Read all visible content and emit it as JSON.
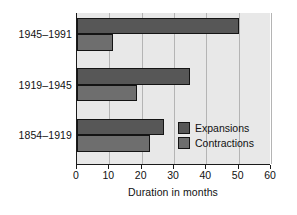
{
  "chart_data": {
    "type": "bar",
    "orientation": "horizontal",
    "title": "",
    "xlabel": "Duration in months",
    "ylabel": "",
    "xlim": [
      0,
      60
    ],
    "xticks": [
      0,
      10,
      20,
      30,
      40,
      50,
      60
    ],
    "xticklabels": [
      "0",
      "10",
      "20",
      "30",
      "40",
      "50",
      "60"
    ],
    "grid": "vertical",
    "categories": [
      "1945–1991",
      "1919–1945",
      "1854–1919"
    ],
    "series": [
      {
        "name": "Expansions",
        "color": "#575757",
        "values": [
          50,
          35,
          27
        ]
      },
      {
        "name": "Contractions",
        "color": "#6e6e6e",
        "values": [
          11,
          18.5,
          22.5
        ]
      }
    ],
    "legend": {
      "position": "inside-lower-right",
      "entries": [
        "Expansions",
        "Contractions"
      ]
    },
    "colors": {
      "plot_background": "#e8e8e8",
      "gridline": "#b4b4b4",
      "axis": "#1a1a1a",
      "bar_outline": "#141414",
      "text": "#111111",
      "page_background": "#ffffff"
    }
  }
}
